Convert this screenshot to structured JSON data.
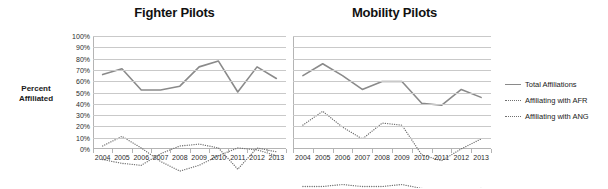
{
  "figure": {
    "y_axis_title_line1": "Percent",
    "y_axis_title_line2": "Affiliated"
  },
  "legend": {
    "position": "right",
    "items": [
      {
        "label": "Total Affiliations",
        "style": "solid",
        "color": "#8a8a8a"
      },
      {
        "label": "Affiliating with AFR",
        "style": "dotted",
        "color": "#6f6f6f"
      },
      {
        "label": "Affiliating with ANG",
        "style": "dotted",
        "color": "#6f6f6f"
      }
    ]
  },
  "chart_data": [
    {
      "type": "line",
      "title": "Fighter Pilots",
      "xlabel": "",
      "ylabel": "Percent Affiliated",
      "ylim": [
        0,
        100
      ],
      "yticks": [
        "0%",
        "10%",
        "20%",
        "30%",
        "40%",
        "50%",
        "60%",
        "70%",
        "80%",
        "90%",
        "100%"
      ],
      "grid": true,
      "categories": [
        "2004",
        "2005",
        "2006",
        "2007",
        "2008",
        "2009",
        "2010",
        "2011",
        "2012",
        "2013"
      ],
      "series": [
        {
          "name": "Total Affiliations",
          "style": "solid",
          "color": "#8a8a8a",
          "values": [
            80,
            83,
            72,
            72,
            74,
            84,
            87,
            71,
            84,
            78
          ]
        },
        {
          "name": "Affiliating with AFR",
          "style": "dotted",
          "color": "#6f6f6f",
          "values": [
            43,
            48,
            42,
            35,
            30,
            33,
            38,
            42,
            41,
            38
          ]
        },
        {
          "name": "Affiliating with ANG",
          "style": "dotted",
          "color": "#6f6f6f",
          "values": [
            36,
            34,
            33,
            39,
            43,
            44,
            42,
            31,
            42,
            40
          ]
        }
      ]
    },
    {
      "type": "line",
      "title": "Mobility Pilots",
      "xlabel": "",
      "ylabel": "Percent Affiliated",
      "ylim": [
        0,
        100
      ],
      "yticks": [
        "0%",
        "10%",
        "20%",
        "30%",
        "40%",
        "50%",
        "60%",
        "70%",
        "80%",
        "90%",
        "100%"
      ],
      "grid": true,
      "categories": [
        "2004",
        "2005",
        "2006",
        "2007",
        "2008",
        "2009",
        "2010",
        "2011",
        "2012",
        "2013"
      ],
      "series": [
        {
          "name": "Total Affiliations",
          "style": "solid",
          "color": "#8a8a8a",
          "values": [
            80,
            86,
            80,
            73,
            77,
            77,
            66,
            65,
            73,
            69
          ]
        },
        {
          "name": "Affiliating with AFR",
          "style": "dotted",
          "color": "#6f6f6f",
          "values": [
            55,
            62,
            54,
            48,
            56,
            55,
            40,
            37,
            43,
            48,
            44
          ]
        },
        {
          "name": "Affiliating with ANG",
          "style": "dotted",
          "color": "#6f6f6f",
          "values": [
            24,
            24,
            25,
            24,
            24,
            25,
            23,
            21,
            21,
            23
          ]
        }
      ]
    }
  ]
}
